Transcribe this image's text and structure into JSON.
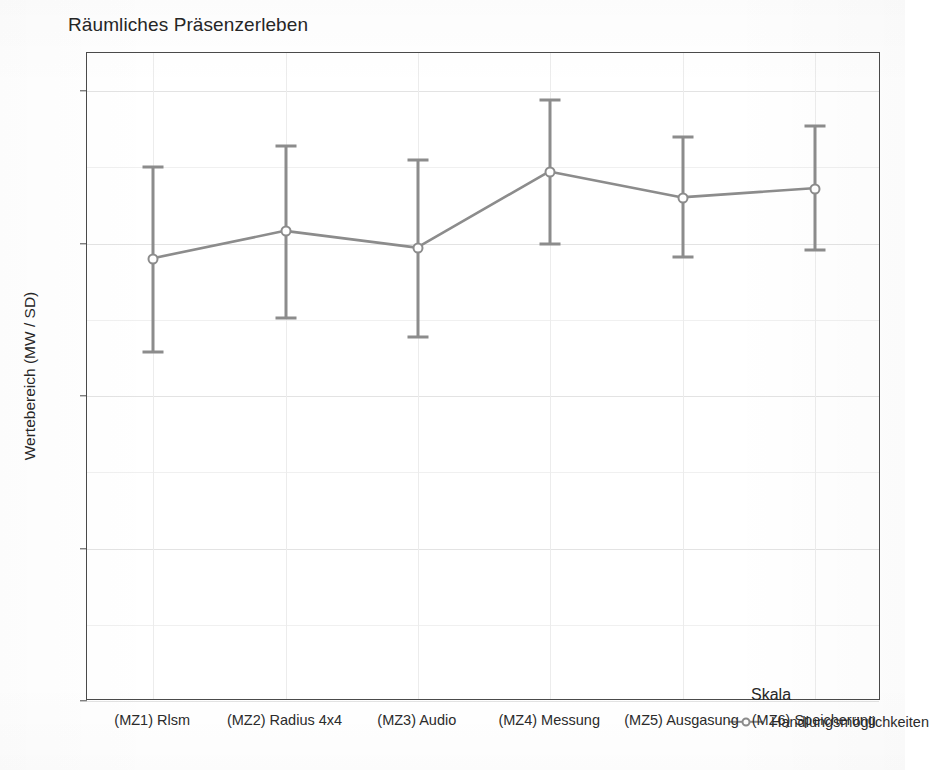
{
  "chart_data": {
    "type": "line",
    "title": "Räumliches Präsenzerleben",
    "xlabel": "",
    "ylabel": "Wertebereich (MW / SD)",
    "ylim": [
      1,
      5.25
    ],
    "yticks": [
      1,
      2,
      3,
      4,
      5
    ],
    "ytick_labels": [
      "1",
      "2",
      "3",
      "4",
      "5"
    ],
    "grid": true,
    "legend_position": "inside-bottom-right",
    "legend_title": "Skala",
    "error_bars": "SD",
    "marker": "open-circle",
    "line_color": "#8c8c8c",
    "categories": [
      "(MZ1) Rlsm",
      "(MZ2) Radius 4x4",
      "(MZ3) Audio",
      "(MZ4)  Messung",
      "(MZ5) Ausgasung",
      "(MZ6) Speicherung"
    ],
    "series": [
      {
        "name": "Handlungsmöglichkeiten",
        "values": [
          3.9,
          4.08,
          3.97,
          4.47,
          4.3,
          4.36
        ],
        "err_low": [
          3.29,
          3.51,
          3.39,
          4.0,
          3.91,
          3.96
        ],
        "err_high": [
          4.5,
          4.64,
          4.55,
          4.94,
          4.7,
          4.77
        ]
      }
    ]
  },
  "legend": {
    "title": "Skala",
    "entries": [
      {
        "label": "Handlungsmöglichkeiten"
      }
    ]
  }
}
